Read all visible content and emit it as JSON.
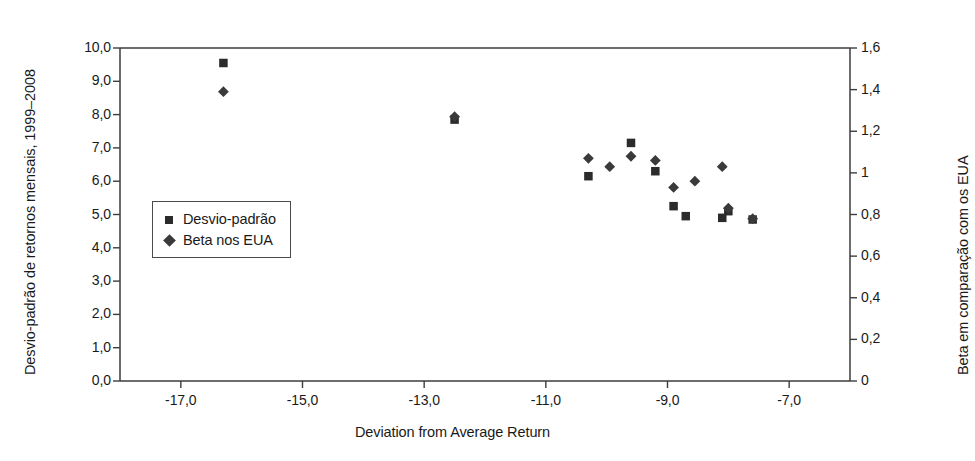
{
  "chart_data": {
    "type": "scatter",
    "title": "",
    "xlabel": "Deviation from Average Return",
    "ylabel_left": "Desvio-padrão de retornos mensais, 1999–2008",
    "ylabel_right": "Beta em comparação com os EUA",
    "xlim": [
      -18.0,
      -6.0
    ],
    "ylim_left": [
      0.0,
      10.0
    ],
    "ylim_right": [
      0.0,
      1.6
    ],
    "grid": false,
    "legend_position": "inside-left",
    "xticks": [
      "-17,0",
      "-15,0",
      "-13,0",
      "-11,0",
      "-9,0",
      "-7,0"
    ],
    "xtick_values": [
      -17.0,
      -15.0,
      -13.0,
      -11.0,
      -9.0,
      -7.0
    ],
    "yticks_left": [
      "0,0",
      "1,0",
      "2,0",
      "3,0",
      "4,0",
      "5,0",
      "6,0",
      "7,0",
      "8,0",
      "9,0",
      "10,0"
    ],
    "ytick_left_values": [
      0.0,
      1.0,
      2.0,
      3.0,
      4.0,
      5.0,
      6.0,
      7.0,
      8.0,
      9.0,
      10.0
    ],
    "yticks_right": [
      "0",
      "0,2",
      "0,4",
      "0,6",
      "0,8",
      "1",
      "1,2",
      "1,4",
      "1,6"
    ],
    "ytick_right_values": [
      0.0,
      0.2,
      0.4,
      0.6,
      0.8,
      1.0,
      1.2,
      1.4,
      1.6
    ],
    "series": [
      {
        "name": "Desvio-padrão",
        "marker": "square",
        "axis": "left",
        "color": "#2b2b2b",
        "points": [
          {
            "x": -16.3,
            "y": 9.55
          },
          {
            "x": -12.5,
            "y": 7.85
          },
          {
            "x": -10.3,
            "y": 6.15
          },
          {
            "x": -9.6,
            "y": 7.15
          },
          {
            "x": -9.2,
            "y": 6.3
          },
          {
            "x": -8.9,
            "y": 5.25
          },
          {
            "x": -8.7,
            "y": 4.95
          },
          {
            "x": -8.1,
            "y": 4.9
          },
          {
            "x": -8.0,
            "y": 5.1
          },
          {
            "x": -7.6,
            "y": 4.85
          }
        ]
      },
      {
        "name": "Beta nos EUA",
        "marker": "diamond",
        "axis": "right",
        "color": "#3a3a3a",
        "points": [
          {
            "x": -16.3,
            "y": 1.39
          },
          {
            "x": -12.5,
            "y": 1.27
          },
          {
            "x": -10.3,
            "y": 1.07
          },
          {
            "x": -9.95,
            "y": 1.03
          },
          {
            "x": -9.6,
            "y": 1.08
          },
          {
            "x": -9.2,
            "y": 1.06
          },
          {
            "x": -8.9,
            "y": 0.93
          },
          {
            "x": -8.55,
            "y": 0.96
          },
          {
            "x": -8.1,
            "y": 1.03
          },
          {
            "x": -8.0,
            "y": 0.83
          },
          {
            "x": -7.6,
            "y": 0.78
          }
        ]
      }
    ]
  },
  "legend": {
    "items": [
      {
        "label": "Desvio-padrão",
        "marker": "square"
      },
      {
        "label": "Beta nos EUA",
        "marker": "diamond"
      }
    ]
  },
  "colors": {
    "axis": "#3d3d3d",
    "marker_square": "#2b2b2b",
    "marker_diamond": "#3a3a3a",
    "text": "#1a1a1a",
    "background": "#ffffff"
  }
}
